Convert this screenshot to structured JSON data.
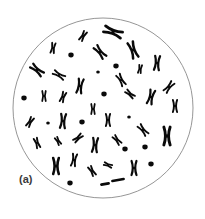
{
  "figure": {
    "panel_label": "(a)",
    "colors": {
      "chromosome": "#0a0a0a",
      "outline": "#8a8a8a",
      "background": "#ffffff",
      "label": "#3a3a3a"
    },
    "field": {
      "cx": 103,
      "cy": 108,
      "r": 90
    },
    "chromosomes": [
      {
        "type": "x",
        "x": 83,
        "y": 36,
        "s": 5,
        "rot": 30
      },
      {
        "type": "x",
        "x": 113,
        "y": 32,
        "s": 9,
        "rot": -70
      },
      {
        "type": "x",
        "x": 53,
        "y": 48,
        "s": 5,
        "rot": 10
      },
      {
        "type": "dot",
        "x": 71,
        "y": 55,
        "s": 3
      },
      {
        "type": "x",
        "x": 100,
        "y": 52,
        "s": 7,
        "rot": -40
      },
      {
        "type": "x",
        "x": 133,
        "y": 50,
        "s": 8,
        "rot": -20
      },
      {
        "type": "dot",
        "x": 116,
        "y": 66,
        "s": 3
      },
      {
        "type": "x",
        "x": 140,
        "y": 69,
        "s": 4,
        "rot": 10
      },
      {
        "type": "x",
        "x": 157,
        "y": 63,
        "s": 7,
        "rot": 5
      },
      {
        "type": "x",
        "x": 37,
        "y": 70,
        "s": 7,
        "rot": -50
      },
      {
        "type": "x",
        "x": 59,
        "y": 75,
        "s": 6,
        "rot": -60
      },
      {
        "type": "x",
        "x": 80,
        "y": 86,
        "s": 7,
        "rot": 10
      },
      {
        "type": "dot",
        "x": 98,
        "y": 72,
        "s": 2
      },
      {
        "type": "x",
        "x": 121,
        "y": 80,
        "s": 6,
        "rot": -30
      },
      {
        "type": "x",
        "x": 169,
        "y": 87,
        "s": 6,
        "rot": 40
      },
      {
        "type": "x",
        "x": 130,
        "y": 94,
        "s": 5,
        "rot": -50
      },
      {
        "type": "x",
        "x": 151,
        "y": 97,
        "s": 7,
        "rot": 15
      },
      {
        "type": "dot",
        "x": 24,
        "y": 98,
        "s": 3
      },
      {
        "type": "x",
        "x": 44,
        "y": 96,
        "s": 5,
        "rot": 0
      },
      {
        "type": "x",
        "x": 63,
        "y": 97,
        "s": 5,
        "rot": 20
      },
      {
        "type": "dot",
        "x": 104,
        "y": 94,
        "s": 3
      },
      {
        "type": "x",
        "x": 93,
        "y": 109,
        "s": 5,
        "rot": 0
      },
      {
        "type": "x",
        "x": 175,
        "y": 106,
        "s": 6,
        "rot": 0
      },
      {
        "type": "x",
        "x": 30,
        "y": 122,
        "s": 5,
        "rot": 30
      },
      {
        "type": "dot",
        "x": 48,
        "y": 123,
        "s": 2
      },
      {
        "type": "x",
        "x": 63,
        "y": 121,
        "s": 7,
        "rot": 5
      },
      {
        "type": "dot",
        "x": 82,
        "y": 122,
        "s": 3
      },
      {
        "type": "x",
        "x": 108,
        "y": 120,
        "s": 6,
        "rot": 0
      },
      {
        "type": "dot",
        "x": 129,
        "y": 117,
        "s": 2
      },
      {
        "type": "x",
        "x": 143,
        "y": 130,
        "s": 6,
        "rot": -40
      },
      {
        "type": "x",
        "x": 167,
        "y": 136,
        "s": 9,
        "rot": 0
      },
      {
        "type": "x",
        "x": 37,
        "y": 143,
        "s": 5,
        "rot": -20
      },
      {
        "type": "x",
        "x": 58,
        "y": 141,
        "s": 4,
        "rot": -30
      },
      {
        "type": "x",
        "x": 78,
        "y": 138,
        "s": 5,
        "rot": 50
      },
      {
        "type": "x",
        "x": 95,
        "y": 145,
        "s": 7,
        "rot": 5
      },
      {
        "type": "x",
        "x": 117,
        "y": 140,
        "s": 5,
        "rot": -40
      },
      {
        "type": "dot",
        "x": 125,
        "y": 149,
        "s": 3
      },
      {
        "type": "dot",
        "x": 145,
        "y": 147,
        "s": 3
      },
      {
        "type": "x",
        "x": 56,
        "y": 166,
        "s": 8,
        "rot": 0
      },
      {
        "type": "x",
        "x": 74,
        "y": 160,
        "s": 6,
        "rot": 10
      },
      {
        "type": "x",
        "x": 92,
        "y": 171,
        "s": 5,
        "rot": -30
      },
      {
        "type": "x",
        "x": 108,
        "y": 165,
        "s": 4,
        "rot": -70
      },
      {
        "type": "x",
        "x": 134,
        "y": 168,
        "s": 7,
        "rot": 0
      },
      {
        "type": "dot",
        "x": 151,
        "y": 164,
        "s": 3
      },
      {
        "type": "dot",
        "x": 70,
        "y": 183,
        "s": 3
      },
      {
        "type": "bar",
        "x": 118,
        "y": 180,
        "s": 7,
        "rot": -10
      },
      {
        "type": "bar",
        "x": 105,
        "y": 184,
        "s": 5,
        "rot": -10
      }
    ]
  }
}
